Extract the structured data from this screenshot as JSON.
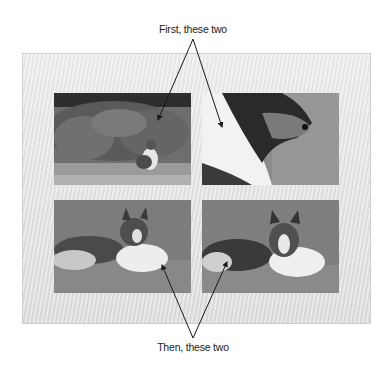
{
  "captions": {
    "top": "First, these two",
    "bottom": "Then, these two"
  },
  "photos": [
    {
      "label": "Sheltie sitting in front of a flowering bush",
      "group": "first"
    },
    {
      "label": "Close-up side profile of sheltie head",
      "group": "first"
    },
    {
      "label": "Sheltie lying on grass, body to left",
      "group": "then"
    },
    {
      "label": "Sheltie lying on grass facing camera",
      "group": "then"
    }
  ],
  "colors": {
    "frame_bg": "#e6e6e6",
    "arrow": "#1a1a1a",
    "text": "#222222"
  }
}
